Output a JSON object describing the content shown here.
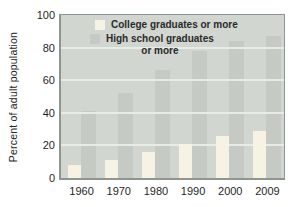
{
  "figure": {
    "legend": [
      {
        "series": "college",
        "lines": [
          "College graduates or more"
        ],
        "swatch_color": "#f6f3e4",
        "indent": 5
      },
      {
        "series": "highschool",
        "lines": [
          "High school graduates",
          "or more"
        ],
        "swatch_color": "#c5cac4",
        "indent": 0
      }
    ]
  },
  "chart_data": {
    "type": "bar",
    "title": "",
    "xlabel": "",
    "ylabel": "Percent of adult population",
    "categories": [
      "1960",
      "1970",
      "1980",
      "1990",
      "2000",
      "2009"
    ],
    "series": [
      {
        "name": "College graduates or more",
        "values": [
          8,
          11,
          16,
          21,
          26,
          29
        ],
        "color": "#f6f3e4"
      },
      {
        "name": "High school graduates or more",
        "values": [
          41,
          52,
          66,
          78,
          84,
          87
        ],
        "color": "#c5cac4"
      }
    ],
    "ylim": [
      0,
      100
    ],
    "y_ticks": [
      0,
      20,
      40,
      60,
      80,
      100
    ],
    "gridline_values": [
      20,
      40,
      60,
      80
    ],
    "grid": true,
    "legend_position": "top-left-inside"
  },
  "colors": {
    "background": "#ffffff",
    "plot_bg": "#d2d6d0",
    "gridline": "#e9ebe6",
    "plot_border": "#8f958f",
    "text": "#1f1f1f",
    "college_bar": "#f6f3e4",
    "highschool_bar": "#c5cac4"
  }
}
